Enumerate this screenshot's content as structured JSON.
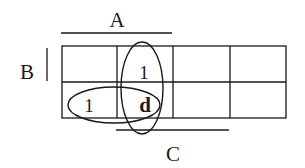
{
  "diagram": {
    "type": "karnaugh-map",
    "rows": 2,
    "cols": 4,
    "labels": {
      "A": "A",
      "B": "B",
      "C": "C"
    },
    "cells": [
      [
        "",
        "1",
        "",
        ""
      ],
      [
        "1",
        "d",
        "",
        ""
      ]
    ],
    "groups": [
      {
        "name": "vertical-group",
        "cells": [
          [
            0,
            1
          ],
          [
            1,
            1
          ]
        ]
      },
      {
        "name": "horizontal-group",
        "cells": [
          [
            1,
            0
          ],
          [
            1,
            1
          ]
        ]
      }
    ],
    "colors": {
      "ink": "#1a1a1a",
      "background": "#ffffff"
    }
  }
}
